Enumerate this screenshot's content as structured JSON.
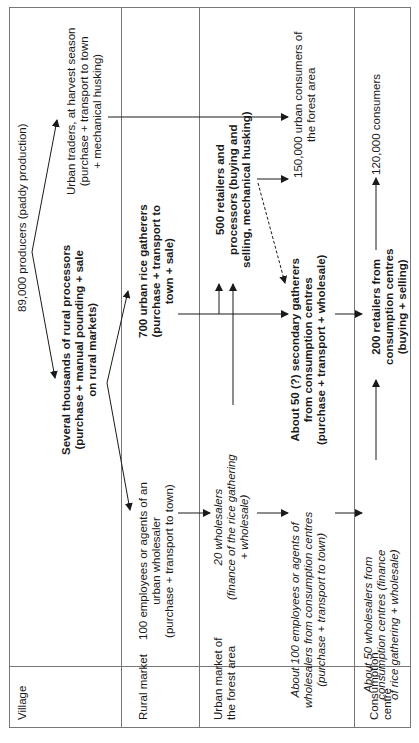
{
  "rows": [
    {
      "label": "Village"
    },
    {
      "label": "Rural market"
    },
    {
      "label_lines": [
        "Urban market of",
        "the forest area"
      ]
    },
    {
      "label_lines": [
        "Consumption",
        "centre"
      ]
    }
  ],
  "nodes": {
    "producers": [
      "89,000 producers (paddy production)"
    ],
    "rural_processors": [
      "Several thousands of rural processors",
      "(purchase + manual pounding + sale",
      "on rural markets)"
    ],
    "urban_traders": [
      "Urban traders, at harvest season",
      "(purchase + transport to town",
      "+ mechanical husking)"
    ],
    "employees_urban_wholesaler": [
      "100 employees or agents of an",
      "urban wholesaler",
      "(purchase + transport to town)"
    ],
    "urban_rice_gatherers": [
      "700 urban rice gatherers",
      "(purchase + transport to",
      "town + sale)"
    ],
    "wholesalers_20": [
      "20 wholesalers",
      "(finance of the rice gathering",
      "+ wholesale)"
    ],
    "retailers_processors_500": [
      "500 retailers and",
      "processors (buying and",
      "selling, mechanical husking)"
    ],
    "urban_consumers": [
      "150,000 urban consumers of",
      "the forest area"
    ],
    "employees_consumption": [
      "About 100 employees or agents of",
      "wholesalers from consumption centres",
      "(purchase + transport to town)"
    ],
    "secondary_gatherers": [
      "About 50 (?) secondary gatherers",
      "from consumption centres",
      "(purchase + transport + wholesale)"
    ],
    "wholesalers_50": [
      "About 50 wholesalers from",
      "consumption centres (finance",
      "of rice gathering + wholesale)"
    ],
    "retailers_200": [
      "200 retailers from",
      "consumption centres",
      "(buying + selling)"
    ],
    "consumers_120000": [
      "120,000 consumers"
    ]
  }
}
